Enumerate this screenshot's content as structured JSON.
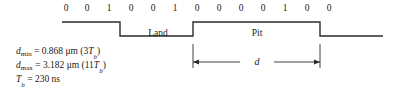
{
  "figure": {
    "line_color": "#2b2b2b",
    "text_color": "#1a1a1a",
    "background": "#ffffff"
  },
  "bits": {
    "sequence": [
      "0",
      "0",
      "1",
      "0",
      "0",
      "1",
      "0",
      "0",
      "0",
      "0",
      "1",
      "0",
      "0"
    ],
    "x_positions": [
      66,
      87,
      109,
      131,
      153,
      175,
      197,
      219,
      241,
      263,
      285,
      307,
      329
    ]
  },
  "waveform": {
    "start_x": 62,
    "end_x": 383,
    "high_y": 22,
    "low_y": 36,
    "initial_level": "high",
    "transitions": [
      {
        "x": 120,
        "to": "low"
      },
      {
        "x": 193,
        "to": "high"
      },
      {
        "x": 320,
        "to": "low"
      }
    ]
  },
  "regions": {
    "land_label": "Land",
    "pit_label": "Pit"
  },
  "dimension": {
    "label": "d",
    "left_x": 193,
    "right_x": 320,
    "arrow_y": 62,
    "ext_top_y": 44,
    "ext_bottom_y": 68
  },
  "equations": [
    {
      "var": "d",
      "sub": "min",
      "sub_italic": false,
      "rest": " = 0.868 μm (3",
      "tail_var": "T",
      "tail_sub": "b",
      "tail_rest": ")"
    },
    {
      "var": "d",
      "sub": "max",
      "sub_italic": false,
      "rest": " = 3.182 μm (11",
      "tail_var": "T",
      "tail_sub": "b",
      "tail_rest": ")"
    },
    {
      "var": "T",
      "sub": "b",
      "sub_italic": true,
      "rest": " = 230 ns",
      "tail_var": "",
      "tail_sub": "",
      "tail_rest": ""
    }
  ]
}
